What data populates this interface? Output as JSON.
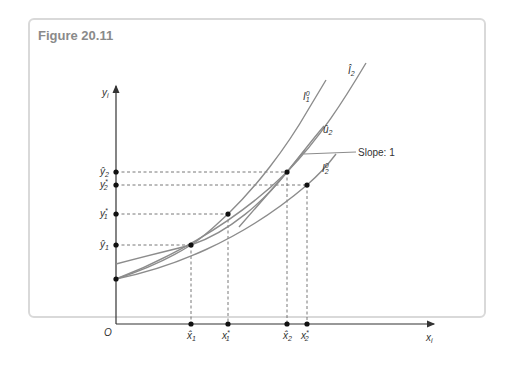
{
  "figure": {
    "title": "Figure 20.11"
  },
  "axes": {
    "y_label": "y",
    "y_label_sub": "i",
    "x_label": "x",
    "x_label_sub": "i",
    "origin_label": "O"
  },
  "y_ticks": [
    {
      "base": "ŷ",
      "sub": "2",
      "sup": ""
    },
    {
      "base": "y",
      "sub": "2",
      "sup": "*"
    },
    {
      "base": "y",
      "sub": "1",
      "sup": "*"
    },
    {
      "base": "ŷ",
      "sub": "1",
      "sup": ""
    }
  ],
  "x_ticks": [
    {
      "base": "x̂",
      "sub": "1",
      "sup": ""
    },
    {
      "base": "x",
      "sub": "1",
      "sup": "*"
    },
    {
      "base": "x̂",
      "sub": "2",
      "sup": ""
    },
    {
      "base": "x",
      "sub": "2",
      "sup": "*"
    }
  ],
  "curves": [
    {
      "base": "I",
      "sub": "1",
      "sup": "0"
    },
    {
      "base": "Î",
      "sub": "2",
      "sup": ""
    },
    {
      "base": "û",
      "sub": "2",
      "sup": ""
    },
    {
      "base": "I",
      "sub": "2",
      "sup": "0"
    }
  ],
  "annotation": {
    "slope_label": "Slope: 1"
  },
  "colors": {
    "curve": "#8c8c8c",
    "axis": "#333333",
    "dash": "#555555",
    "frame": "#d9d9d9",
    "title": "#8a8a8a"
  }
}
